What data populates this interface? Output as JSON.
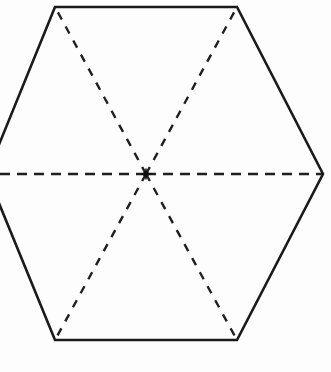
{
  "figure": {
    "title": "Regular hexagon divided into six triangles",
    "shape_name": "hexagon",
    "background_color": "#fdfdfd",
    "outline_color": "#1a1a1a",
    "dash_color": "#1f1f1f",
    "canvas": {
      "width": 331,
      "height": 372
    }
  },
  "chart_data": {
    "type": "diagram",
    "title": "Regular hexagon divided into six triangles",
    "xlabel": "",
    "ylabel": "",
    "grid": false,
    "legend": "none",
    "xlim": [
      0,
      331
    ],
    "ylim": [
      0,
      372
    ],
    "center": {
      "label": "center",
      "x": 146,
      "y": 174
    },
    "vertices": [
      {
        "label": "top-left",
        "x": 55,
        "y": 7,
        "visible": true
      },
      {
        "label": "top-right",
        "x": 237,
        "y": 7,
        "visible": true
      },
      {
        "label": "right",
        "x": 323,
        "y": 174,
        "visible": true
      },
      {
        "label": "bottom-right",
        "x": 237,
        "y": 340,
        "visible": true
      },
      {
        "label": "bottom-left",
        "x": 55,
        "y": 340,
        "visible": true
      },
      {
        "label": "left",
        "x": -13,
        "y": 174,
        "visible": false
      }
    ],
    "solid_edges": [
      {
        "label": "top-edge",
        "from": "top-left",
        "to": "top-right"
      },
      {
        "label": "upper-right-edge",
        "from": "top-right",
        "to": "right"
      },
      {
        "label": "lower-right-edge",
        "from": "right",
        "to": "bottom-right"
      },
      {
        "label": "bottom-edge",
        "from": "bottom-right",
        "to": "bottom-left"
      },
      {
        "label": "lower-left-edge",
        "from": "bottom-left",
        "to": "left"
      },
      {
        "label": "upper-left-edge",
        "from": "left",
        "to": "top-left"
      }
    ],
    "dashed_segments": [
      {
        "label": "diagonal-center-to-top-left",
        "from": "center",
        "to": "top-left",
        "style": "dashed"
      },
      {
        "label": "diagonal-center-to-top-right",
        "from": "center",
        "to": "top-right",
        "style": "dashed"
      },
      {
        "label": "diagonal-center-to-bottom-right",
        "from": "center",
        "to": "bottom-right",
        "style": "dashed"
      },
      {
        "label": "diagonal-center-to-bottom-left",
        "from": "center",
        "to": "bottom-left",
        "style": "dashed"
      },
      {
        "label": "horizontal-axis-left",
        "from": "center",
        "to": "left",
        "style": "dashed"
      },
      {
        "label": "horizontal-axis-right",
        "from": "center",
        "to": "right",
        "style": "dashed"
      }
    ],
    "triangle_count": 6
  }
}
